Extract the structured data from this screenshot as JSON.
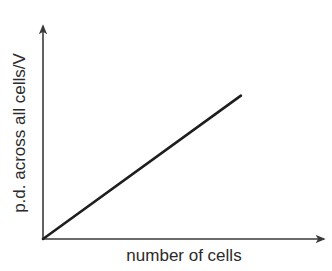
{
  "chart_data": {
    "type": "line",
    "title": "",
    "xlabel": "number of cells",
    "ylabel": "p.d. across all cells/V",
    "x_ticks": [],
    "y_ticks": [],
    "grid": false,
    "legend": null,
    "series": [
      {
        "name": "p.d. vs number of cells",
        "description": "straight line through origin (directly proportional)",
        "points": [
          [
            0,
            0
          ],
          [
            1,
            1
          ]
        ]
      }
    ],
    "xlim": [
      0,
      1.43
    ],
    "ylim": [
      0,
      1.5
    ],
    "annotations": []
  },
  "colors": {
    "axis": "#3a3a3a",
    "line": "#1e1e1e",
    "text": "#2b2b2b",
    "background": "#ffffff"
  }
}
